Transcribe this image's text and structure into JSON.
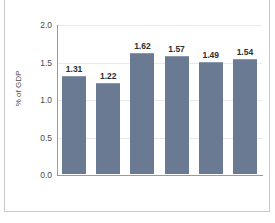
{
  "chart_data": {
    "type": "bar",
    "title": "",
    "xlabel": "",
    "ylabel": "% of GDP",
    "categories": [
      "2007",
      "2008",
      "2009",
      "2010",
      "2011",
      "2012"
    ],
    "values": [
      1.31,
      1.22,
      1.62,
      1.57,
      1.49,
      1.54
    ],
    "value_labels": [
      "1.31",
      "1.22",
      "1.62",
      "1.57",
      "1.49",
      "1.54"
    ],
    "ylim": [
      0.0,
      2.0
    ],
    "y_ticks": [
      0.0,
      0.5,
      1.0,
      1.5,
      2.0
    ],
    "y_tick_labels": [
      "0.0",
      "0.5",
      "1.0",
      "1.5",
      "2.0"
    ],
    "grid": true,
    "legend": false,
    "legend_position": "none",
    "bar_color": "#6b7a93",
    "gridline_color": "#e8eaee",
    "axis_color": "#9a9a9a"
  },
  "figure": {
    "caption": ""
  }
}
